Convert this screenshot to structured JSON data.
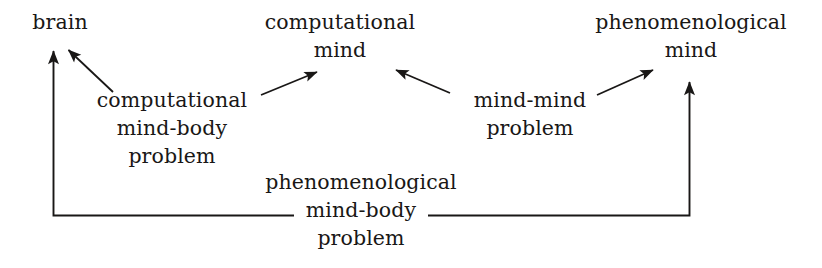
{
  "diagram": {
    "type": "directed-graph",
    "background_color": "#ffffff",
    "ink_color": "#191716",
    "nodes": [
      {
        "id": "brain",
        "lines": [
          "brain"
        ]
      },
      {
        "id": "computational-mind",
        "lines": [
          "computational",
          "mind"
        ]
      },
      {
        "id": "phenomenological-mind",
        "lines": [
          "phenomenological",
          "mind"
        ]
      },
      {
        "id": "computational-mind-body-problem",
        "lines": [
          "computational",
          "mind-body",
          "problem"
        ]
      },
      {
        "id": "mind-mind-problem",
        "lines": [
          "mind-mind",
          "problem"
        ]
      },
      {
        "id": "phenomenological-mind-body-problem",
        "lines": [
          "phenomenological",
          "mind-body",
          "problem"
        ]
      }
    ],
    "edges": [
      {
        "from": "computational-mind-body-problem",
        "to": "brain",
        "style": "diagonal-arrow"
      },
      {
        "from": "computational-mind-body-problem",
        "to": "computational-mind",
        "style": "diagonal-arrow"
      },
      {
        "from": "mind-mind-problem",
        "to": "computational-mind",
        "style": "diagonal-arrow"
      },
      {
        "from": "mind-mind-problem",
        "to": "phenomenological-mind",
        "style": "diagonal-arrow"
      },
      {
        "from": "phenomenological-mind-body-problem",
        "to": "brain",
        "style": "elbow-arrow-left"
      },
      {
        "from": "phenomenological-mind-body-problem",
        "to": "phenomenological-mind",
        "style": "elbow-arrow-right"
      }
    ]
  },
  "nodes": {
    "brain": {
      "l0": "brain"
    },
    "computational_mind": {
      "l0": "computational",
      "l1": "mind"
    },
    "phenomenological_mind": {
      "l0": "phenomenological",
      "l1": "mind"
    },
    "computational_mind_body_problem": {
      "l0": "computational",
      "l1": "mind-body",
      "l2": "problem"
    },
    "mind_mind_problem": {
      "l0": "mind-mind",
      "l1": "problem"
    },
    "phenomenological_mind_body_problem": {
      "l0": "phenomenological",
      "l1": "mind-body",
      "l2": "problem"
    }
  }
}
